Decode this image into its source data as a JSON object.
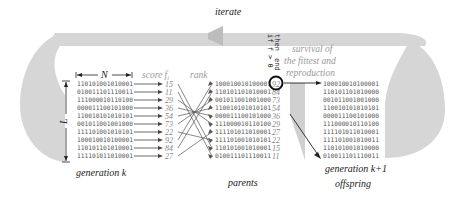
{
  "title_labels": {
    "iterate": "iterate",
    "generation_k": "generation k",
    "parents": "parents",
    "generation_k1": "generation k+1",
    "offspring": "offspring",
    "score": "score f",
    "score_sub": "i",
    "rank": "rank",
    "N": "N",
    "L": "L",
    "survival_line1": "survival of",
    "survival_line2": "the fittest and",
    "survival_line3": "reproduction",
    "condition_line1": "if f > θ",
    "condition_line2": "then",
    "condition_line3": "end"
  },
  "generation_k": {
    "strings": [
      "110101001010001",
      "010011101110011",
      "111000010110100",
      "000011100101000",
      "110010101010101",
      "001011001001000",
      "111101001010101",
      "100010010100001",
      "110101101010001",
      "111101011010001"
    ],
    "scores": [
      "15",
      "11",
      "29",
      "36",
      "54",
      "73",
      "22",
      "92",
      "84",
      "27"
    ]
  },
  "parents": {
    "strings": [
      "100010010100001",
      "110101101010001",
      "001011001001000",
      "110010101010101",
      "000011100101000",
      "111000010110100",
      "111101011010001",
      "111101001010101",
      "110101001010001",
      "010011101110011"
    ],
    "scores": [
      "92",
      "84",
      "73",
      "54",
      "36",
      "29",
      "27",
      "22",
      "15",
      "11"
    ]
  },
  "offspring": {
    "strings": [
      "100010010100001",
      "110101101010000",
      "001011001001000",
      "110010101010101",
      "000011100101000",
      "111000010110100",
      "111101011010001",
      "111101001010011",
      "110101001010000",
      "010011101110011"
    ]
  },
  "colors": {
    "loop_fill": "#d4d4d4",
    "arrow": "#444444",
    "text": "#222222",
    "muted": "#888888"
  }
}
